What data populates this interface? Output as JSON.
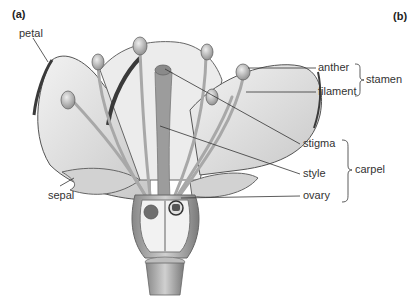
{
  "figure": {
    "panel_labels": [
      "(a)",
      "(b)"
    ],
    "labels": {
      "petal": "petal",
      "sepal": "sepal",
      "anther": "anther",
      "filament": "filament",
      "stamen": "stamen",
      "stigma": "stigma",
      "style": "style",
      "ovary": "ovary",
      "carpel": "carpel"
    },
    "groups": [
      {
        "name": "stamen",
        "members": [
          "anther",
          "filament"
        ]
      },
      {
        "name": "carpel",
        "members": [
          "stigma",
          "style",
          "ovary"
        ]
      }
    ],
    "colors": {
      "background": "#ffffff",
      "petal_fill": "#e6e6e6",
      "petal_edge": "#4a4a4a",
      "stamen_fill": "#b5b5b5",
      "carpel_fill": "#9a9a9a",
      "leader_line": "#333333",
      "text": "#333333"
    }
  }
}
